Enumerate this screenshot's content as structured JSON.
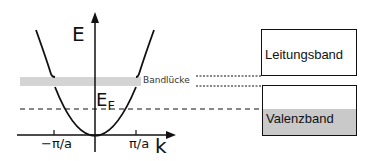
{
  "diagram": {
    "axes": {
      "y_label": "E",
      "x_label": "k",
      "x_ticks": [
        "−π/a",
        "π/a"
      ]
    },
    "fermi_level": {
      "label": "E",
      "subscript": "F"
    },
    "band_gap_label": "Bandlücke",
    "bands": {
      "conduction": "Leitungsband",
      "valence": "Valenzband"
    },
    "colors": {
      "line": "#111111",
      "gap_fill": "#d4d4d4",
      "valence_fill": "#c9c9c9"
    }
  }
}
